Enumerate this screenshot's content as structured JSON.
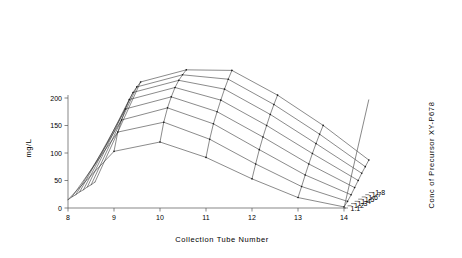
{
  "chart_data": {
    "type": "line",
    "subtype": "3d-wireframe-surface",
    "title": "",
    "xlabel": "Collection Tube Number",
    "ylabel": "mg/L",
    "zlabel": "Conc of Precursor XY-P678",
    "x": [
      8,
      9,
      10,
      11,
      12,
      13,
      14
    ],
    "xticklabels": [
      "8",
      "9",
      "10",
      "11",
      "12",
      "13",
      "14"
    ],
    "yticks": [
      0,
      50,
      100,
      150,
      200
    ],
    "yticklabels": [
      "0",
      "50",
      "100",
      "150",
      "200"
    ],
    "ylim": [
      0,
      215
    ],
    "zticklabels": [
      "1.1",
      "1.2",
      "1.3",
      "1.4",
      "1.5",
      "1.6",
      "1.7",
      "1.8"
    ],
    "grid": false,
    "legend": false,
    "categories": [
      "8",
      "9",
      "10",
      "11",
      "12",
      "13",
      "14"
    ],
    "series": [
      {
        "name": "1.1",
        "values": [
          15,
          103,
          120,
          92,
          53,
          19,
          2
        ]
      },
      {
        "name": "1.2",
        "values": [
          16,
          134,
          152,
          121,
          76,
          35,
          8
        ]
      },
      {
        "name": "1.3",
        "values": [
          16,
          152,
          174,
          145,
          98,
          52,
          16
        ]
      },
      {
        "name": "1.4",
        "values": [
          17,
          168,
          190,
          163,
          117,
          68,
          25
        ]
      },
      {
        "name": "1.5",
        "values": [
          17,
          181,
          203,
          180,
          134,
          83,
          34
        ]
      },
      {
        "name": "1.6",
        "values": [
          18,
          190,
          212,
          196,
          150,
          97,
          43
        ]
      },
      {
        "name": "1.7",
        "values": [
          18,
          196,
          218,
          210,
          164,
          110,
          51
        ]
      },
      {
        "name": "1.8",
        "values": [
          19,
          201,
          223,
          222,
          177,
          122,
          59
        ]
      }
    ]
  },
  "axes": {
    "x_title": "Collection Tube Number",
    "y_title": "mg/L",
    "z_title": "Conc of Precursor XY-P678",
    "x_ticks": [
      "8",
      "9",
      "10",
      "11",
      "12",
      "13",
      "14"
    ],
    "y_ticks": [
      "200",
      "150",
      "100",
      "50",
      "0"
    ],
    "z_ticks": [
      "1.8",
      "1.7",
      "1.6",
      "1.5",
      "1.4",
      "1.3",
      "1.2",
      "1.1"
    ]
  },
  "style": {
    "mesh_color": "#2b2b2b",
    "axis_color": "#555555",
    "background": "#ffffff"
  }
}
